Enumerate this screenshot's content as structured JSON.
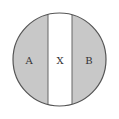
{
  "diagram": {
    "type": "circle-divided-into-three-vertical-regions",
    "regions": [
      {
        "id": "A",
        "label": "A",
        "fill": "#c8c8c8"
      },
      {
        "id": "X",
        "label": "X",
        "fill": "#ffffff"
      },
      {
        "id": "B",
        "label": "B",
        "fill": "#c8c8c8"
      }
    ],
    "colors": {
      "shaded": "#c8c8c8",
      "band": "#ffffff",
      "outline": "#555555"
    }
  }
}
